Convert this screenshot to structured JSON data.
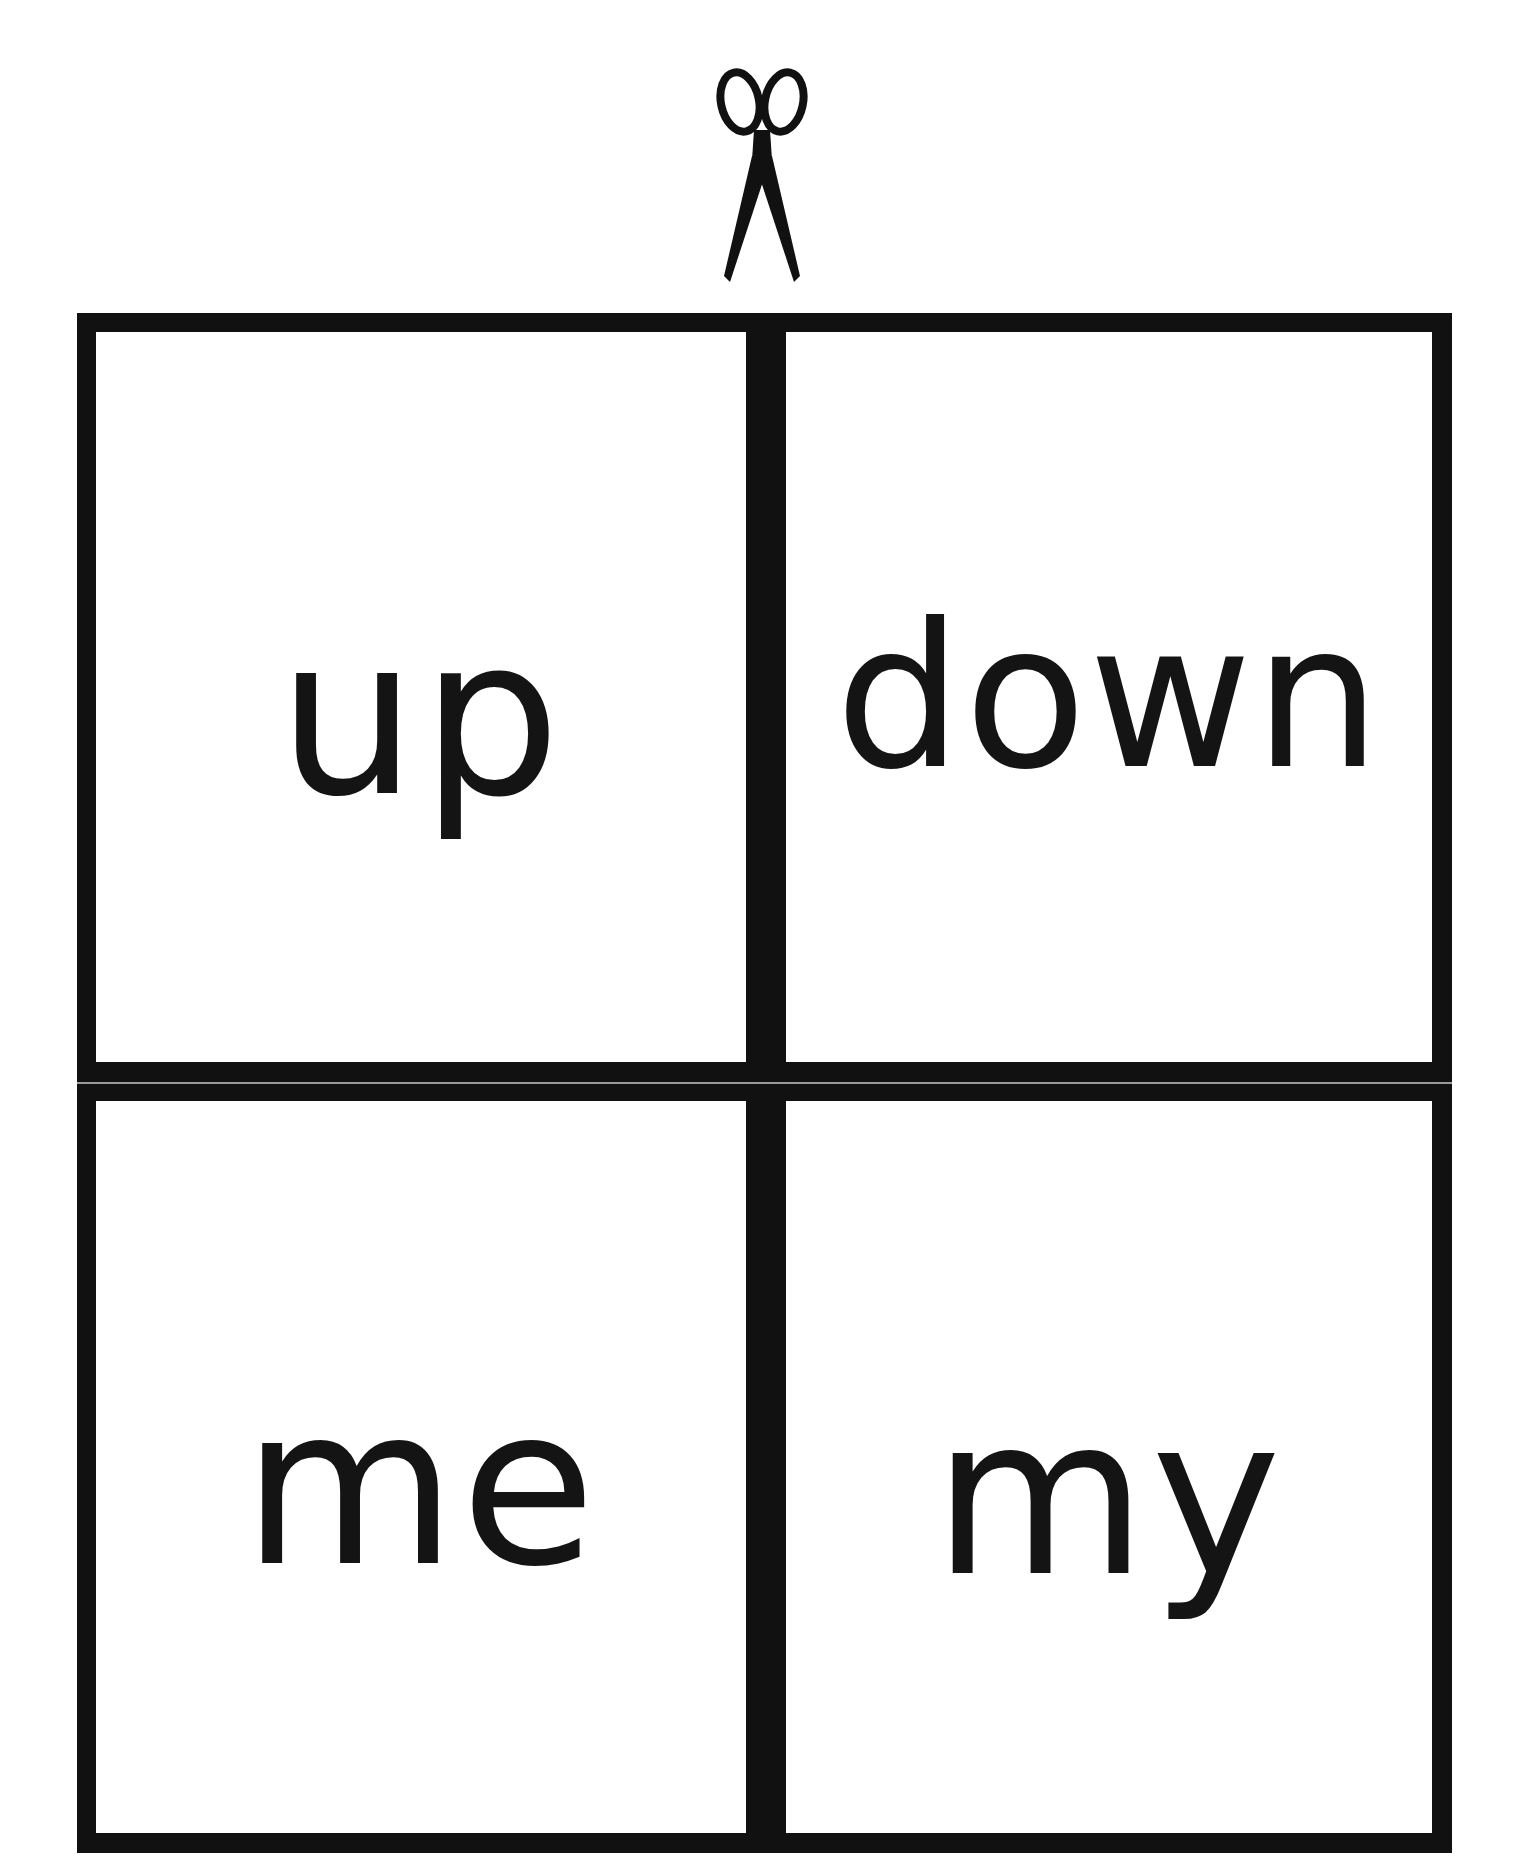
{
  "page": {
    "background": "#ffffff",
    "line_color": "#111111"
  },
  "cut_marker": {
    "icon": "scissors-icon"
  },
  "cards": [
    {
      "word": "up"
    },
    {
      "word": "down"
    },
    {
      "word": "me"
    },
    {
      "word": "my"
    }
  ]
}
